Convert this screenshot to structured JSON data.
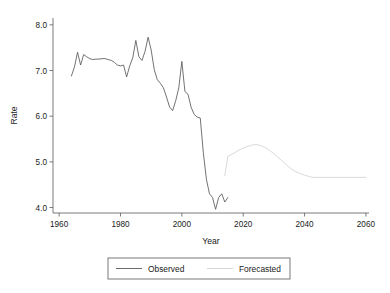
{
  "chart_data": {
    "type": "line",
    "title": "",
    "xlabel": "Year",
    "ylabel": "Rate",
    "xlim": [
      1958,
      2061
    ],
    "ylim": [
      3.88,
      8.15
    ],
    "xticks": [
      1960,
      1980,
      2000,
      2020,
      2040,
      2060
    ],
    "xtick_labels": [
      "1960",
      "1980",
      "2000",
      "2020",
      "2040",
      "2060"
    ],
    "yticks": [
      4.0,
      5.0,
      6.0,
      7.0,
      8.0
    ],
    "ytick_labels": [
      "4.0",
      "5.0",
      "6.0",
      "7.0",
      "8.0"
    ],
    "grid": false,
    "legend_position": "bottom",
    "series": [
      {
        "name": "Observed",
        "color": "#5a5a5a",
        "x": [
          1964,
          1965,
          1966,
          1967,
          1968,
          1969,
          1970,
          1971,
          1972,
          1973,
          1974,
          1975,
          1976,
          1977,
          1978,
          1979,
          1980,
          1981,
          1982,
          1983,
          1984,
          1985,
          1986,
          1987,
          1988,
          1989,
          1990,
          1991,
          1992,
          1993,
          1994,
          1995,
          1996,
          1997,
          1998,
          1999,
          2000,
          2001,
          2002,
          2003,
          2004,
          2005,
          2006,
          2007,
          2008,
          2009,
          2010,
          2011,
          2012,
          2013,
          2014,
          2015
        ],
        "y": [
          6.88,
          7.08,
          7.4,
          7.12,
          7.35,
          7.3,
          7.26,
          7.24,
          7.25,
          7.25,
          7.26,
          7.26,
          7.24,
          7.22,
          7.18,
          7.12,
          7.1,
          7.12,
          6.86,
          7.1,
          7.28,
          7.66,
          7.3,
          7.22,
          7.42,
          7.73,
          7.45,
          7.02,
          6.8,
          6.72,
          6.62,
          6.42,
          6.2,
          6.12,
          6.34,
          6.62,
          7.2,
          6.54,
          6.48,
          6.2,
          6.04,
          5.98,
          5.96,
          5.2,
          4.62,
          4.3,
          4.22,
          3.96,
          4.22,
          4.3,
          4.12,
          4.22
        ]
      },
      {
        "name": "Forecasted",
        "color": "#d2d2d2",
        "x": [
          2014,
          2015,
          2016,
          2017,
          2018,
          2019,
          2020,
          2021,
          2022,
          2023,
          2024,
          2025,
          2026,
          2027,
          2028,
          2029,
          2030,
          2031,
          2032,
          2033,
          2034,
          2035,
          2036,
          2037,
          2038,
          2039,
          2040,
          2041,
          2042,
          2043,
          2044,
          2046,
          2048,
          2050,
          2052,
          2054,
          2056,
          2058,
          2060
        ],
        "y": [
          4.7,
          5.12,
          5.16,
          5.19,
          5.23,
          5.27,
          5.3,
          5.33,
          5.35,
          5.37,
          5.38,
          5.37,
          5.35,
          5.32,
          5.28,
          5.23,
          5.18,
          5.12,
          5.06,
          5.0,
          4.94,
          4.88,
          4.83,
          4.79,
          4.76,
          4.73,
          4.71,
          4.69,
          4.67,
          4.66,
          4.66,
          4.66,
          4.66,
          4.66,
          4.66,
          4.66,
          4.66,
          4.66,
          4.66
        ]
      }
    ]
  },
  "legend": {
    "items": [
      {
        "label": "Observed",
        "color": "#5a5a5a"
      },
      {
        "label": "Forecasted",
        "color": "#d2d2d2"
      }
    ]
  },
  "axes": {
    "y_title": "Rate",
    "x_title": "Year"
  }
}
